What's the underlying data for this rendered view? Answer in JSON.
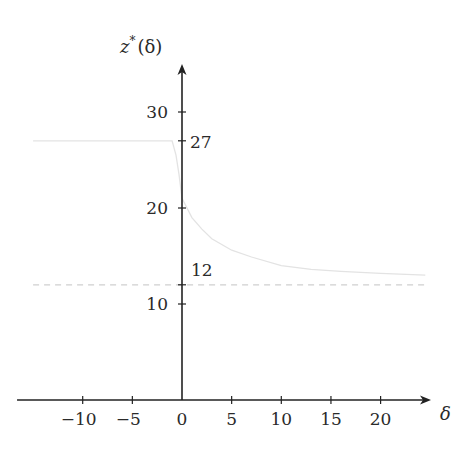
{
  "chart_data": {
    "type": "line",
    "title": "",
    "xlabel": "δ",
    "ylabel": "z*(δ)",
    "xlim": [
      -15,
      25
    ],
    "ylim": [
      0,
      35
    ],
    "grid": false,
    "legend": null,
    "x_ticks": [
      -10,
      -5,
      0,
      5,
      10,
      15,
      20
    ],
    "x_tick_labels": [
      "−10",
      "−5",
      "0",
      "5",
      "10",
      "15",
      "20"
    ],
    "y_ticks": [
      10,
      20,
      30
    ],
    "y_tick_labels": [
      "10",
      "20",
      "30"
    ],
    "annotations": [
      {
        "text": "27",
        "y": 27,
        "note": "tick mark on y-axis, level of left plateau"
      },
      {
        "text": "12",
        "y": 12,
        "note": "horizontal asymptote, dashed line"
      }
    ],
    "series": [
      {
        "name": "z*(δ)",
        "style": "solid",
        "color": "#e3e3e3",
        "x": [
          -15,
          -10,
          -5,
          -1,
          -0.6,
          -0.3,
          0,
          0.5,
          1,
          2,
          3,
          5,
          7,
          10,
          13,
          16,
          20,
          24.5
        ],
        "y": [
          27,
          27,
          27,
          27,
          25.5,
          23.5,
          21,
          20,
          19,
          17.8,
          16.8,
          15.6,
          14.9,
          14.0,
          13.6,
          13.4,
          13.2,
          13.0
        ]
      },
      {
        "name": "asymptote z = 12",
        "style": "dashed",
        "color": "#cfcfcf",
        "x": [
          -15,
          24.5
        ],
        "y": [
          12,
          12
        ]
      }
    ]
  },
  "labels": {
    "y_axis": "z",
    "y_axis_sup": "*",
    "y_axis_arg": "(δ)",
    "x_axis": "δ",
    "mark_27": "27",
    "mark_12": "12"
  },
  "colors": {
    "axis": "#222222",
    "curve": "#e3e3e3",
    "asymptote": "#cfcfcf",
    "text": "#2a2a2a"
  }
}
